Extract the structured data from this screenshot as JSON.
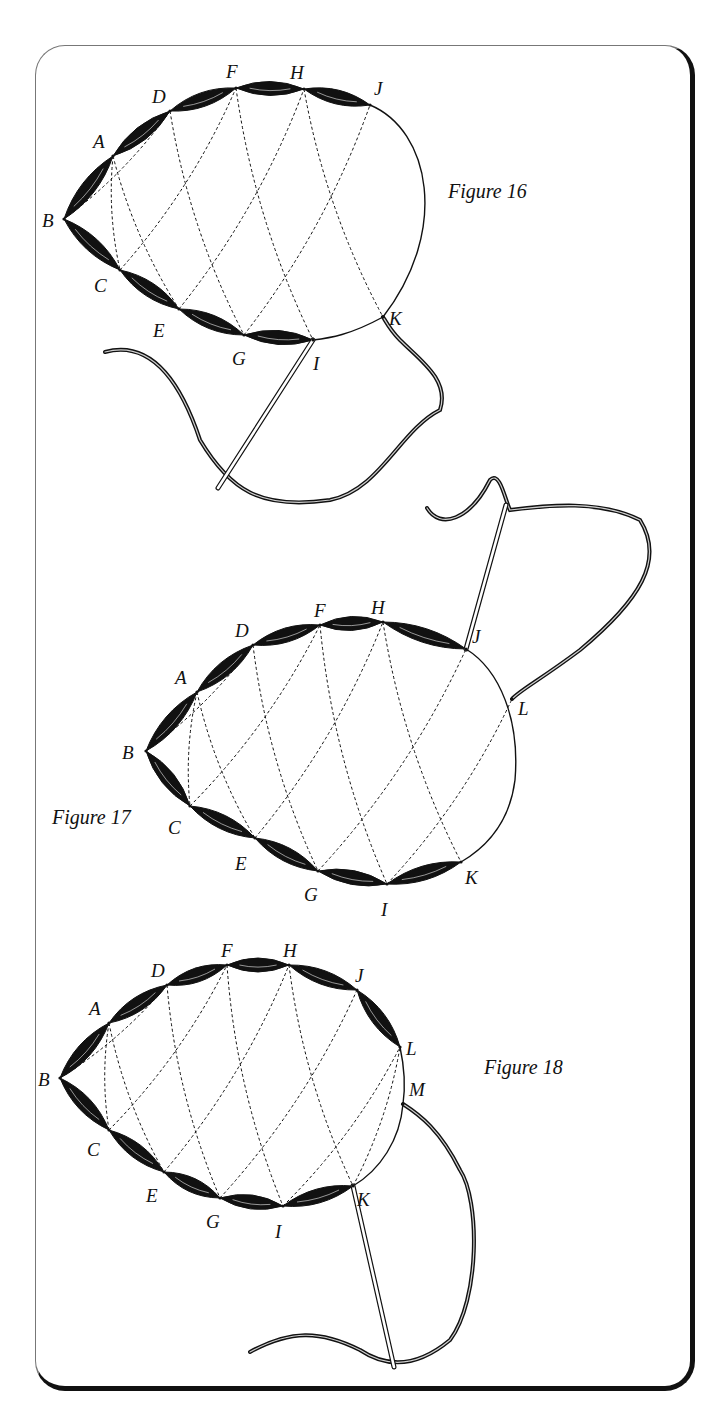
{
  "figures": [
    {
      "id": "fig16",
      "label": "Figure 16",
      "label_pos": [
        448,
        192
      ],
      "points": {
        "A": [
          113,
          156
        ],
        "B": [
          64,
          219
        ],
        "C": [
          120,
          270
        ],
        "D": [
          170,
          111
        ],
        "E": [
          179,
          309
        ],
        "F": [
          236,
          88
        ],
        "G": [
          244,
          335
        ],
        "H": [
          304,
          89
        ],
        "I": [
          313,
          340
        ],
        "J": [
          370,
          105
        ],
        "K": [
          383,
          317
        ]
      },
      "label_offsets": {
        "A": [
          -20,
          -8
        ],
        "B": [
          -22,
          8
        ],
        "C": [
          -26,
          22
        ],
        "D": [
          -18,
          -8
        ],
        "E": [
          -26,
          28
        ],
        "F": [
          -10,
          -10
        ],
        "G": [
          -12,
          30
        ],
        "H": [
          -14,
          -10
        ],
        "I": [
          0,
          30
        ],
        "J": [
          4,
          -10
        ],
        "K": [
          6,
          8
        ]
      },
      "stitched": [
        [
          "B",
          "A"
        ],
        [
          "A",
          "D"
        ],
        [
          "D",
          "F"
        ],
        [
          "F",
          "H"
        ],
        [
          "H",
          "J"
        ],
        [
          "B",
          "C"
        ],
        [
          "C",
          "E"
        ],
        [
          "E",
          "G"
        ],
        [
          "G",
          "I"
        ]
      ],
      "outline_path": "M370,105 C430,130 450,230 383,317 C350,335 330,338 313,340",
      "dashed": [
        [
          "B",
          "D"
        ],
        [
          "B",
          "C"
        ],
        [
          "A",
          "E"
        ],
        [
          "D",
          "G"
        ],
        [
          "F",
          "I"
        ],
        [
          "H",
          "K"
        ],
        [
          "C",
          "F"
        ],
        [
          "E",
          "H"
        ],
        [
          "G",
          "J"
        ],
        [
          "A",
          "C"
        ]
      ],
      "thread_path": "M105,352 C150,340 180,380 200,440 C230,490 260,510 330,500 C380,490 400,430 440,410 C450,380 420,360 400,340 C390,330 385,320 383,317",
      "needle": {
        "eye": [
          218,
          488
        ],
        "tip": [
          313,
          340
        ]
      }
    },
    {
      "id": "fig17",
      "label": "Figure 17",
      "label_pos": [
        52,
        818
      ],
      "points": {
        "A": [
          197,
          692
        ],
        "B": [
          146,
          751
        ],
        "C": [
          190,
          806
        ],
        "D": [
          253,
          645
        ],
        "E": [
          255,
          838
        ],
        "F": [
          320,
          625
        ],
        "G": [
          318,
          871
        ],
        "H": [
          383,
          622
        ],
        "I": [
          387,
          884
        ],
        "J": [
          466,
          649
        ],
        "K": [
          461,
          862
        ],
        "L": [
          512,
          699
        ]
      },
      "label_offsets": {
        "A": [
          -22,
          -8
        ],
        "B": [
          -24,
          8
        ],
        "C": [
          -22,
          28
        ],
        "D": [
          -18,
          -8
        ],
        "E": [
          -20,
          32
        ],
        "F": [
          -6,
          -8
        ],
        "G": [
          -14,
          30
        ],
        "H": [
          -12,
          -8
        ],
        "I": [
          -6,
          32
        ],
        "J": [
          6,
          -6
        ],
        "K": [
          4,
          22
        ],
        "L": [
          6,
          16
        ]
      },
      "stitched": [
        [
          "B",
          "A"
        ],
        [
          "A",
          "D"
        ],
        [
          "D",
          "F"
        ],
        [
          "F",
          "H"
        ],
        [
          "H",
          "J"
        ],
        [
          "B",
          "C"
        ],
        [
          "C",
          "E"
        ],
        [
          "E",
          "G"
        ],
        [
          "G",
          "I"
        ],
        [
          "I",
          "K"
        ]
      ],
      "outline_path": "M466,649 C500,670 520,720 515,780 C510,820 490,845 461,862",
      "dashed": [
        [
          "B",
          "D"
        ],
        [
          "B",
          "C"
        ],
        [
          "A",
          "E"
        ],
        [
          "D",
          "G"
        ],
        [
          "F",
          "I"
        ],
        [
          "H",
          "K"
        ],
        [
          "C",
          "F"
        ],
        [
          "E",
          "H"
        ],
        [
          "G",
          "J"
        ],
        [
          "I",
          "L"
        ],
        [
          "A",
          "C"
        ]
      ],
      "thread_path": "M427,508 C440,530 470,520 490,480 C500,470 505,500 510,510 C550,505 600,500 640,520 C665,560 640,600 580,650 C540,680 520,690 512,699",
      "needle": {
        "eye": [
          506,
          505
        ],
        "tip": [
          466,
          649
        ]
      }
    },
    {
      "id": "fig18",
      "label": "Figure 18",
      "label_pos": [
        484,
        1068
      ],
      "points": {
        "A": [
          109,
          1023
        ],
        "B": [
          60,
          1078
        ],
        "C": [
          109,
          1130
        ],
        "D": [
          167,
          985
        ],
        "E": [
          164,
          1172
        ],
        "F": [
          227,
          965
        ],
        "G": [
          220,
          1198
        ],
        "H": [
          289,
          965
        ],
        "I": [
          283,
          1206
        ],
        "J": [
          357,
          990
        ],
        "K": [
          353,
          1186
        ],
        "L": [
          400,
          1047
        ],
        "M": [
          403,
          1104
        ]
      },
      "label_offsets": {
        "A": [
          -20,
          -8
        ],
        "B": [
          -22,
          8
        ],
        "C": [
          -22,
          26
        ],
        "D": [
          -16,
          -8
        ],
        "E": [
          -18,
          30
        ],
        "F": [
          -6,
          -8
        ],
        "G": [
          -14,
          30
        ],
        "H": [
          -6,
          -8
        ],
        "I": [
          -8,
          32
        ],
        "J": [
          -2,
          -8
        ],
        "K": [
          4,
          20
        ],
        "L": [
          6,
          8
        ],
        "M": [
          6,
          -8
        ]
      },
      "stitched": [
        [
          "B",
          "A"
        ],
        [
          "A",
          "D"
        ],
        [
          "D",
          "F"
        ],
        [
          "F",
          "H"
        ],
        [
          "H",
          "J"
        ],
        [
          "J",
          "L"
        ],
        [
          "B",
          "C"
        ],
        [
          "C",
          "E"
        ],
        [
          "E",
          "G"
        ],
        [
          "G",
          "I"
        ],
        [
          "I",
          "K"
        ]
      ],
      "outline_path": "M400,1047 C405,1070 405,1090 403,1104 C400,1140 380,1170 353,1186",
      "dashed": [
        [
          "B",
          "D"
        ],
        [
          "B",
          "C"
        ],
        [
          "A",
          "E"
        ],
        [
          "D",
          "G"
        ],
        [
          "F",
          "I"
        ],
        [
          "H",
          "K"
        ],
        [
          "C",
          "F"
        ],
        [
          "E",
          "H"
        ],
        [
          "G",
          "J"
        ],
        [
          "I",
          "L"
        ],
        [
          "K",
          "L"
        ],
        [
          "A",
          "C"
        ]
      ],
      "thread_path": "M250,1352 C290,1330 320,1330 360,1350 C390,1370 420,1365 450,1340 C480,1300 480,1200 460,1170 C440,1130 420,1115 403,1104",
      "needle": {
        "eye": [
          394,
          1367
        ],
        "tip": [
          353,
          1186
        ]
      }
    }
  ],
  "caption": {
    "note": "Body text below frame is clipped at image edge; only glyph tops visible"
  },
  "colors": {
    "ink": "#111111",
    "frame_light": "#777777",
    "frame_shadow": "#111111",
    "paper": "#ffffff"
  }
}
